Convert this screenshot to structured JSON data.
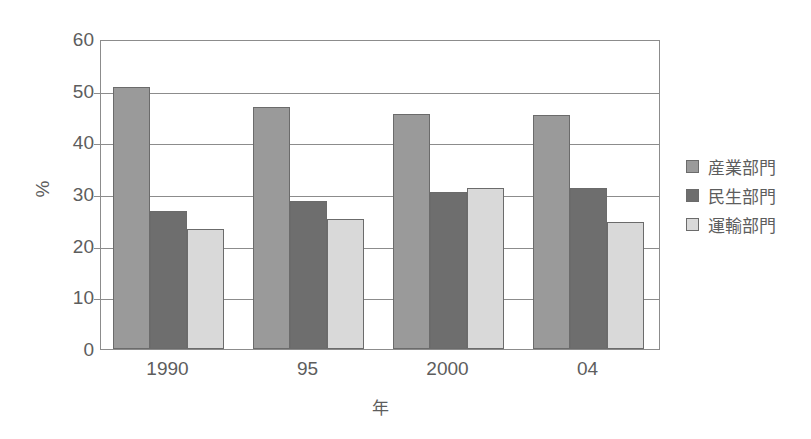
{
  "chart_data": {
    "type": "bar",
    "title": "",
    "subtitle": "",
    "xlabel": "年",
    "ylabel": "%",
    "categories": [
      "1990",
      "95",
      "2000",
      "04"
    ],
    "series": [
      {
        "name": "産業部門",
        "values": [
          50.7,
          46.8,
          45.5,
          45.2
        ],
        "color": "#9a9a9a"
      },
      {
        "name": "民生部門",
        "values": [
          26.8,
          28.6,
          30.4,
          31.2
        ],
        "color": "#6e6e6e"
      },
      {
        "name": "運輸部門",
        "values": [
          23.2,
          25.1,
          31.1,
          24.5
        ],
        "color": "#d9d9d9"
      }
    ],
    "ylim": [
      0,
      60
    ],
    "yticks": [
      0,
      10,
      20,
      30,
      40,
      50,
      60
    ],
    "ytick_labels": [
      "0",
      "10",
      "20",
      "30",
      "40",
      "50",
      "60"
    ],
    "grid": true,
    "grid_axis": "y",
    "legend_position": "right"
  },
  "axes": {
    "y_title": "%",
    "x_title": "年"
  },
  "legend": {
    "items": [
      {
        "label": "産業部門",
        "color": "#9a9a9a"
      },
      {
        "label": "民生部門",
        "color": "#6e6e6e"
      },
      {
        "label": "運輸部門",
        "color": "#d9d9d9"
      }
    ]
  },
  "colors": {
    "axis": "#8c8c8c",
    "text": "#5d5d5d",
    "bar_border": "#6b6b6b",
    "background": "#ffffff"
  }
}
